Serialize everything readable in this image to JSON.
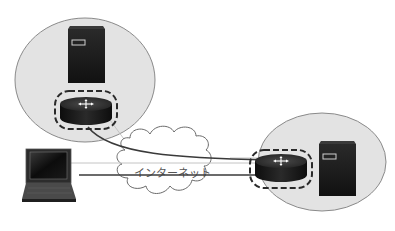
{
  "diagram": {
    "title": "",
    "cloud": {
      "label": "インターネット",
      "icon": "cloud-icon"
    },
    "sites": [
      {
        "name": "site-a",
        "devices": [
          {
            "type": "server",
            "icon": "server-icon"
          },
          {
            "type": "router",
            "icon": "router-icon",
            "highlighted": true
          }
        ]
      },
      {
        "name": "site-b",
        "devices": [
          {
            "type": "router",
            "icon": "router-icon",
            "highlighted": true
          },
          {
            "type": "server",
            "icon": "server-icon"
          }
        ]
      }
    ],
    "client": {
      "type": "laptop",
      "icon": "laptop-icon"
    },
    "connections": [
      {
        "from": "site-a-router",
        "to": "site-b-router",
        "style": "thick"
      },
      {
        "from": "laptop",
        "to": "site-b-router",
        "style": "thick"
      },
      {
        "from": "laptop",
        "to": "site-b-router",
        "style": "thin"
      },
      {
        "from": "site-a-router",
        "to": "cloud",
        "style": "thin"
      }
    ],
    "colors": {
      "site_fill": "#e3e3e3",
      "site_stroke": "#8a8a8a",
      "line_dark": "#3a3a3a",
      "line_light": "#c4c4c4",
      "device_dark": "#1c1c1c"
    }
  }
}
